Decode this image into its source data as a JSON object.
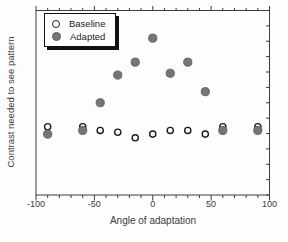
{
  "colors": {
    "background": "#fdfdfd",
    "frame": "#3d3d3d",
    "tick": "#3d3d3d",
    "text": "#3a3a3a",
    "legend_border": "#111111"
  },
  "chart_data": {
    "type": "scatter",
    "title": "",
    "xlabel": "Angle of adaptation",
    "ylabel": "Contrast needed to see pattern",
    "xlim": [
      -100,
      100
    ],
    "ylim": [
      0,
      1
    ],
    "x_ticks": [
      -100,
      -50,
      0,
      50,
      100
    ],
    "x_minor_tick_step": 10,
    "y_tick_count": 13,
    "y_tick_labels_shown": false,
    "grid": false,
    "legend_position": "upper-left",
    "x": [
      -90,
      -60,
      -45,
      -30,
      -15,
      0,
      15,
      30,
      45,
      60,
      90
    ],
    "series": [
      {
        "name": "Baseline",
        "marker": "open-circle",
        "fill": "#ffffff",
        "edge": "#1c1c1c",
        "values": [
          0.37,
          0.37,
          0.35,
          0.34,
          0.31,
          0.33,
          0.35,
          0.35,
          0.33,
          0.37,
          0.37
        ]
      },
      {
        "name": "Adapted",
        "marker": "filled-circle",
        "fill": "#757575",
        "edge": "#5e5e5e",
        "values": [
          0.33,
          0.35,
          0.5,
          0.65,
          0.72,
          0.85,
          0.66,
          0.72,
          0.56,
          0.35,
          0.35
        ]
      }
    ]
  }
}
